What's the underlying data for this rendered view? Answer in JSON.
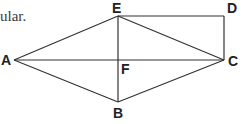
{
  "text_fragment": "ular.",
  "diagram": {
    "points": {
      "A": {
        "label": "A",
        "x": 14,
        "y": 60
      },
      "B": {
        "label": "B",
        "x": 118,
        "y": 102
      },
      "C": {
        "label": "C",
        "x": 224,
        "y": 60
      },
      "D": {
        "label": "D",
        "x": 224,
        "y": 16
      },
      "E": {
        "label": "E",
        "x": 118,
        "y": 16
      },
      "F": {
        "label": "F",
        "x": 118,
        "y": 60
      }
    },
    "segments": [
      "AE",
      "EC",
      "CB",
      "BA",
      "AC",
      "EB",
      "ED",
      "DC"
    ],
    "line_color": "#333333"
  }
}
